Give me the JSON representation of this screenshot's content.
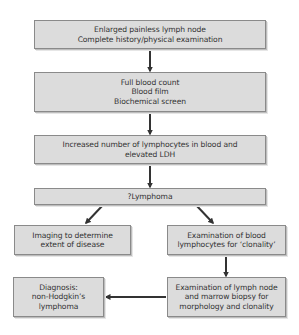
{
  "diagram": {
    "type": "flowchart",
    "nodes": [
      {
        "id": "presentation",
        "lines": [
          "Enlarged painless lymph node",
          "Complete history/physical examination"
        ]
      },
      {
        "id": "initial-tests",
        "lines": [
          "Full blood count",
          "Blood film",
          "Biochemical screen"
        ]
      },
      {
        "id": "findings",
        "lines": [
          "Increased number of lymphocytes in blood and",
          "elevated LDH"
        ]
      },
      {
        "id": "suspicion",
        "lines": [
          "?Lymphoma"
        ]
      },
      {
        "id": "imaging",
        "lines": [
          "Imaging to determine",
          "extent of disease"
        ]
      },
      {
        "id": "clonality",
        "lines": [
          "Examination of blood",
          "lymphocytes for ‘clonality’"
        ]
      },
      {
        "id": "biopsy",
        "lines": [
          "Examination of lymph node",
          "and marrow biopsy for",
          "morphology and clonality"
        ]
      },
      {
        "id": "diagnosis",
        "lines": [
          "Diagnosis:",
          "non-Hodgkin’s",
          "lymphoma"
        ]
      }
    ],
    "edges": [
      {
        "from": "presentation",
        "to": "initial-tests"
      },
      {
        "from": "initial-tests",
        "to": "findings"
      },
      {
        "from": "findings",
        "to": "suspicion"
      },
      {
        "from": "suspicion",
        "to": "imaging"
      },
      {
        "from": "suspicion",
        "to": "clonality"
      },
      {
        "from": "clonality",
        "to": "biopsy"
      },
      {
        "from": "biopsy",
        "to": "diagnosis"
      }
    ],
    "colors": {
      "box_fill": "#dcdcdc",
      "box_border": "#8a8a8a",
      "arrow": "#333333",
      "text": "#333333"
    }
  }
}
